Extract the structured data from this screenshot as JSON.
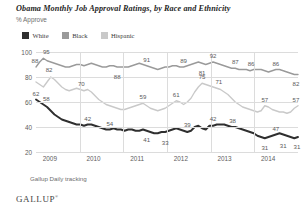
{
  "chart_data": {
    "type": "line",
    "title": "Obama Monthly Job Approval Ratings, by Race and Ethnicity",
    "subtitle": "% Approve",
    "xlabel": "",
    "ylabel": "",
    "ylim": [
      20,
      100
    ],
    "yticks": [
      20,
      40,
      60,
      80,
      100
    ],
    "xticks": [
      "2009",
      "2010",
      "2011",
      "2012",
      "2013",
      "2014"
    ],
    "grid": true,
    "legend_position": "top-left",
    "source": "Gallup Daily tracking",
    "brand": "GALLUP",
    "colors": {
      "white": "#2f2f2f",
      "black": "#9a9a9a",
      "hispanic": "#c9c9c9",
      "grid": "#dcdcdc",
      "text": "#5a5a5a"
    },
    "series": [
      {
        "name": "White",
        "color": "#2f2f2f",
        "values": [
          62,
          60,
          58,
          56,
          53,
          50,
          48,
          46,
          45,
          44,
          43,
          42,
          42,
          41,
          42,
          42,
          41,
          40,
          39,
          38,
          38,
          39,
          38,
          38,
          37,
          38,
          38,
          37,
          37,
          38,
          37,
          36,
          35,
          35,
          36,
          36,
          37,
          38,
          39,
          38,
          37,
          36,
          37,
          40,
          41,
          39,
          38,
          41,
          41,
          42,
          42,
          42,
          41,
          40,
          40,
          39,
          38,
          37,
          36,
          35,
          33,
          32,
          31,
          32,
          33,
          34,
          35,
          34,
          33,
          32,
          31,
          32
        ]
      },
      {
        "name": "Black",
        "color": "#9a9a9a",
        "values": [
          88,
          92,
          95,
          93,
          92,
          91,
          90,
          89,
          88,
          88,
          89,
          90,
          90,
          89,
          90,
          91,
          90,
          89,
          88,
          88,
          89,
          89,
          88,
          88,
          88,
          88,
          89,
          90,
          91,
          90,
          89,
          88,
          87,
          86,
          87,
          88,
          88,
          89,
          89,
          88,
          88,
          89,
          90,
          91,
          92,
          91,
          90,
          91,
          92,
          91,
          90,
          89,
          88,
          87,
          87,
          86,
          86,
          86,
          85,
          86,
          86,
          86,
          85,
          84,
          85,
          86,
          86,
          85,
          84,
          83,
          82,
          82
        ]
      },
      {
        "name": "Hispanic",
        "color": "#c9c9c9",
        "values": [
          76,
          74,
          72,
          76,
          80,
          78,
          75,
          72,
          70,
          69,
          70,
          71,
          70,
          69,
          70,
          68,
          65,
          62,
          60,
          58,
          57,
          56,
          55,
          54,
          54,
          55,
          56,
          57,
          58,
          59,
          57,
          55,
          54,
          53,
          54,
          55,
          57,
          59,
          61,
          60,
          58,
          60,
          63,
          68,
          72,
          75,
          74,
          73,
          72,
          71,
          70,
          68,
          66,
          63,
          60,
          58,
          56,
          55,
          54,
          53,
          52,
          53,
          57,
          56,
          54,
          53,
          52,
          52,
          51,
          52,
          55,
          57
        ]
      }
    ],
    "point_labels": [
      {
        "series": "Black",
        "text": "88",
        "x": 0,
        "y": 88,
        "dx": -1,
        "dy": -7
      },
      {
        "series": "Black",
        "text": "95",
        "x": 2,
        "y": 95,
        "dx": 3,
        "dy": -7
      },
      {
        "series": "Black",
        "text": "82",
        "x": 3,
        "y": 93,
        "dx": 2,
        "dy": 8
      },
      {
        "series": "Black",
        "text": "88",
        "x": 22,
        "y": 88,
        "dx": 0,
        "dy": 9
      },
      {
        "series": "Black",
        "text": "91",
        "x": 30,
        "y": 89,
        "dx": 0,
        "dy": -7
      },
      {
        "series": "Black",
        "text": "81",
        "x": 45,
        "y": 91,
        "dx": 0,
        "dy": 9
      },
      {
        "series": "Black",
        "text": "89",
        "x": 40,
        "y": 88,
        "dx": 0,
        "dy": -7
      },
      {
        "series": "Black",
        "text": "92",
        "x": 48,
        "y": 92,
        "dx": 0,
        "dy": -7
      },
      {
        "series": "Black",
        "text": "87",
        "x": 54,
        "y": 87,
        "dx": 0,
        "dy": -7
      },
      {
        "series": "Black",
        "text": "86",
        "x": 58,
        "y": 86,
        "dx": 1,
        "dy": -7
      },
      {
        "series": "Black",
        "text": "86",
        "x": 65,
        "y": 86,
        "dx": 0,
        "dy": -7
      },
      {
        "series": "Black",
        "text": "82",
        "x": 71,
        "y": 82,
        "dx": -2,
        "dy": 8
      },
      {
        "series": "Hispanic",
        "text": "70",
        "x": 12,
        "y": 70,
        "dx": 1,
        "dy": -7
      },
      {
        "series": "Hispanic",
        "text": "59",
        "x": 29,
        "y": 59,
        "dx": 0,
        "dy": -7
      },
      {
        "series": "Hispanic",
        "text": "61",
        "x": 38,
        "y": 61,
        "dx": 0,
        "dy": -7
      },
      {
        "series": "Hispanic",
        "text": "75",
        "x": 45,
        "y": 75,
        "dx": 0,
        "dy": -7
      },
      {
        "series": "Hispanic",
        "text": "71",
        "x": 49,
        "y": 71,
        "dx": 2,
        "dy": -7
      },
      {
        "series": "Hispanic",
        "text": "57",
        "x": 62,
        "y": 57,
        "dx": 0,
        "dy": -7
      },
      {
        "series": "Hispanic",
        "text": "57",
        "x": 71,
        "y": 57,
        "dx": -2,
        "dy": -7
      },
      {
        "series": "White",
        "text": "62",
        "x": 0,
        "y": 62,
        "dx": 0,
        "dy": -7
      },
      {
        "series": "White",
        "text": "58",
        "x": 2,
        "y": 58,
        "dx": 3,
        "dy": -7
      },
      {
        "series": "White",
        "text": "42",
        "x": 14,
        "y": 42,
        "dx": 0,
        "dy": -7
      },
      {
        "series": "White",
        "text": "54",
        "x": 20,
        "y": 38,
        "dx": 0,
        "dy": -7
      },
      {
        "series": "White",
        "text": "41",
        "x": 30,
        "y": 37,
        "dx": 0,
        "dy": 8
      },
      {
        "series": "White",
        "text": "33",
        "x": 35,
        "y": 35,
        "dx": 0,
        "dy": 9
      },
      {
        "series": "White",
        "text": "39",
        "x": 41,
        "y": 37,
        "dx": 0,
        "dy": -7
      },
      {
        "series": "White",
        "text": "42",
        "x": 48,
        "y": 42,
        "dx": 0,
        "dy": -7
      },
      {
        "series": "White",
        "text": "38",
        "x": 53,
        "y": 40,
        "dx": 1,
        "dy": -7
      },
      {
        "series": "White",
        "text": "31",
        "x": 62,
        "y": 31,
        "dx": 0,
        "dy": 9
      },
      {
        "series": "White",
        "text": "47",
        "x": 65,
        "y": 34,
        "dx": 0,
        "dy": -7
      },
      {
        "series": "White",
        "text": "31",
        "x": 67,
        "y": 34,
        "dx": 0,
        "dy": 10
      },
      {
        "series": "White",
        "text": "31",
        "x": 71,
        "y": 32,
        "dx": -1,
        "dy": 9
      }
    ]
  },
  "legend": {
    "items": [
      {
        "label": "White",
        "color": "#2f2f2f"
      },
      {
        "label": "Black",
        "color": "#9a9a9a"
      },
      {
        "label": "Hispanic",
        "color": "#c9c9c9"
      }
    ]
  }
}
